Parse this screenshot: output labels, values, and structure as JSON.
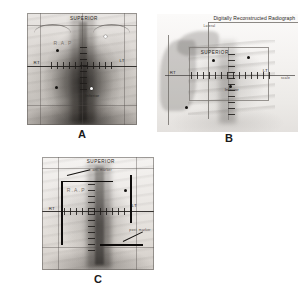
{
  "figure": {
    "panels": [
      {
        "id": "A",
        "letter": "A",
        "type": "conventional-radiograph",
        "labels": {
          "superior": "SUPERIOR",
          "right": "RT",
          "left": "LT",
          "rap": "R.A.P",
          "inferior": "Inferior"
        }
      },
      {
        "id": "B",
        "letter": "B",
        "type": "digitally-reconstructed-radiograph",
        "labels": {
          "title": "Digitally Reconstructed Radiograph",
          "corner": "Lateral",
          "superior": "SUPERIOR",
          "right": "RT",
          "left": "LT",
          "inferior": "Inferior",
          "edge": "scale"
        }
      },
      {
        "id": "C",
        "letter": "C",
        "type": "overlay-registration",
        "labels": {
          "superior": "SUPERIOR",
          "right": "RT",
          "left": "LT",
          "rap": "R.A.P",
          "annotation_top": "ant. marker",
          "annotation_bottom": "post. marker"
        }
      }
    ]
  },
  "colors": {
    "ink": "#141210",
    "film_light": "#f2f0ee",
    "film_dark": "#b9b4af",
    "graticule": "#2d2a28",
    "faint_text": "#7a736c"
  }
}
